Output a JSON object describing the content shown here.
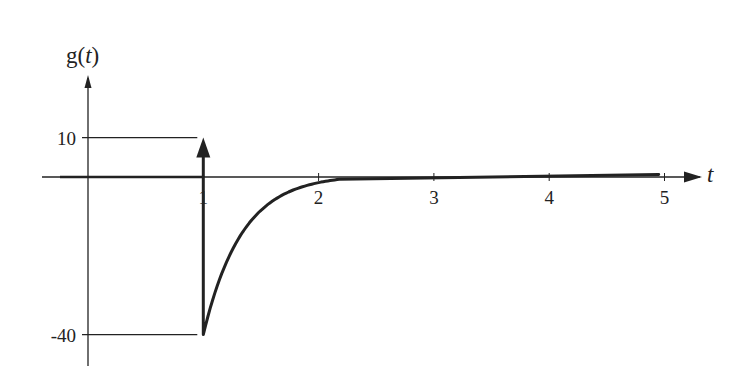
{
  "chart_data": {
    "type": "line",
    "title": "",
    "ylabel": "g(t)",
    "ylabel_parts": {
      "prefix": "g(",
      "var": "t",
      "suffix": ")"
    },
    "xlabel": "t",
    "x_ticks": [
      1,
      2,
      3,
      4,
      5
    ],
    "x_tick_labels": [
      "1",
      "2",
      "3",
      "4",
      "5"
    ],
    "y_ticks": [
      10,
      -40
    ],
    "y_tick_labels": [
      "10",
      "-40"
    ],
    "xlim": [
      -0.25,
      5.3
    ],
    "ylim": [
      -47,
      26
    ],
    "grid": false,
    "legend": null,
    "series": [
      {
        "name": "g(t) continuous part",
        "description": "zero for t<1, jumps to -40 at t=1, then decays exponentially back to ~0 by t≈2",
        "x": [
          0,
          1,
          1,
          1.1,
          1.2,
          1.3,
          1.4,
          1.5,
          1.6,
          1.7,
          1.8,
          1.9,
          2.0,
          2.2,
          2.5,
          3,
          4,
          5
        ],
        "y": [
          0,
          0,
          -40,
          -29.6,
          -21.9,
          -16.2,
          -12.0,
          -8.9,
          -6.5,
          -4.8,
          -3.6,
          -2.6,
          -1.0,
          0.4,
          0.6,
          0.6,
          0.6,
          0.6
        ]
      },
      {
        "name": "impulse",
        "type": "impulse",
        "x": 1,
        "y": 10,
        "description": "delta impulse at t=1 with weight 10 (arrow)"
      }
    ],
    "annotations": [
      {
        "type": "reference-line",
        "y": 10,
        "from_x": 0,
        "to_x": 1
      },
      {
        "type": "reference-line",
        "y": -40,
        "from_x": 0,
        "to_x": 1
      }
    ]
  },
  "colors": {
    "ink": "#222222",
    "background": "#ffffff"
  }
}
